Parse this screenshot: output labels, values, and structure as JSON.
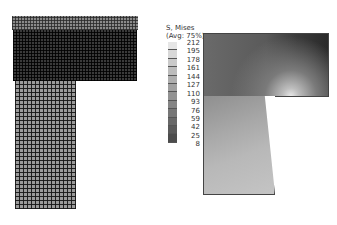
{
  "figure": {
    "left_panel": {
      "label": "finite element mesh"
    },
    "right_panel": {
      "label": "stress contour",
      "legend": {
        "title_line1": "S, Mises",
        "title_line2": "(Avg: 75%)",
        "values": [
          "212",
          "195",
          "178",
          "161",
          "144",
          "127",
          "110",
          "93",
          "76",
          "59",
          "42",
          "25",
          "8"
        ],
        "colors": [
          "#e6e6e6",
          "#d8d8d8",
          "#cacaca",
          "#bcbcbc",
          "#aeaeae",
          "#a0a0a0",
          "#929292",
          "#848484",
          "#767676",
          "#686868",
          "#5a5a5a",
          "#4c4c4c"
        ]
      }
    }
  }
}
